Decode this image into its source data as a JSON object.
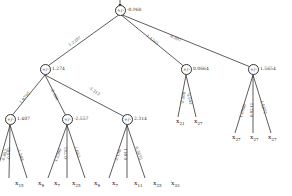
{
  "tree": {
    "root": {
      "op": "+/-",
      "value": "-0.968"
    },
    "level1": [
      {
        "op": "+/-",
        "value": "1.274",
        "edge": "1.2207"
      },
      {
        "op": "+/-",
        "value": "0.0664",
        "edge": "1.1263"
      },
      {
        "op": "+/-",
        "value": "1.5654",
        "edge": "-0.802"
      }
    ],
    "level2": [
      {
        "op": "+/-",
        "value": "1.407",
        "edge": "1.0795"
      },
      {
        "op": "+/-",
        "value": "-2.557",
        "edge": "-0.966"
      },
      {
        "op": "+/-",
        "value": "2.314",
        "edge": "-1.313"
      }
    ],
    "leaves": [
      {
        "label": "x",
        "sub": "15",
        "edge": "-0.653"
      },
      {
        "label": "x",
        "sub": "9",
        "edge": "-0.995"
      },
      {
        "label": "x",
        "sub": "7",
        "edge": "-1.388"
      },
      {
        "label": "x",
        "sub": "25",
        "edge": "1.2586"
      },
      {
        "label": "x",
        "sub": "9",
        "edge": "-0.743"
      },
      {
        "label": "x",
        "sub": "7",
        "edge": "1.663"
      },
      {
        "label": "x",
        "sub": "11",
        "edge": "-2.138"
      },
      {
        "label": "x",
        "sub": "25",
        "edge": "0.641"
      },
      {
        "label": "x",
        "sub": "33",
        "edge": "0.3675"
      },
      {
        "label": "x",
        "sub": "21",
        "edge": "-2.268"
      },
      {
        "label": "x",
        "sub": "27",
        "edge": "0.543"
      },
      {
        "label": "x",
        "sub": "27",
        "edge": "1.0986"
      },
      {
        "label": "x",
        "sub": "27",
        "edge": "0.9212"
      },
      {
        "label": "x",
        "sub": "27",
        "edge": "1.5872"
      }
    ]
  }
}
